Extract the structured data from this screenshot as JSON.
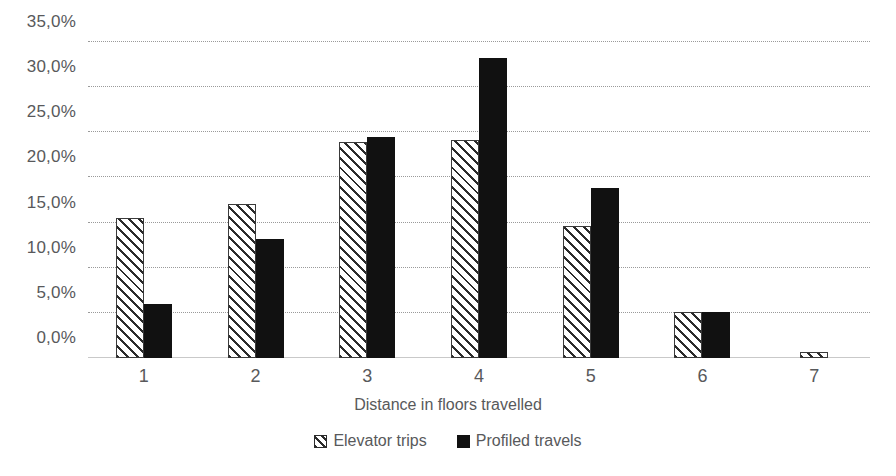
{
  "chart_data": {
    "type": "bar",
    "title": "",
    "subtitle": "",
    "xlabel": "Distance in floors travelled",
    "ylabel": "",
    "categories": [
      "1",
      "2",
      "3",
      "4",
      "5",
      "6",
      "7"
    ],
    "series": [
      {
        "name": "Elevator trips",
        "style": "hatched",
        "color": "#2b2b2b",
        "values": [
          15.5,
          17.1,
          23.9,
          24.2,
          14.6,
          5.1,
          0.7
        ]
      },
      {
        "name": "Profiled travels",
        "style": "solid",
        "color": "#111111",
        "values": [
          6.0,
          13.2,
          24.5,
          33.2,
          18.8,
          5.1,
          0.0
        ]
      }
    ],
    "ylim": [
      0,
      35
    ],
    "y_ticks": [
      0,
      5,
      10,
      15,
      20,
      25,
      30,
      35
    ],
    "y_tick_labels": [
      "0,0%",
      "5,0%",
      "10,0%",
      "15,0%",
      "20,0%",
      "25,0%",
      "30,0%",
      "35,0%"
    ],
    "grid": "horizontal-dotted",
    "grid_color": "#9a9a9a",
    "legend_position": "bottom-center",
    "value_format": "percent-comma-decimal"
  },
  "legend": {
    "items": [
      {
        "label": "Elevator trips",
        "swatch": "hatched-square-icon"
      },
      {
        "label": "Profiled travels",
        "swatch": "solid-square-icon"
      }
    ]
  }
}
